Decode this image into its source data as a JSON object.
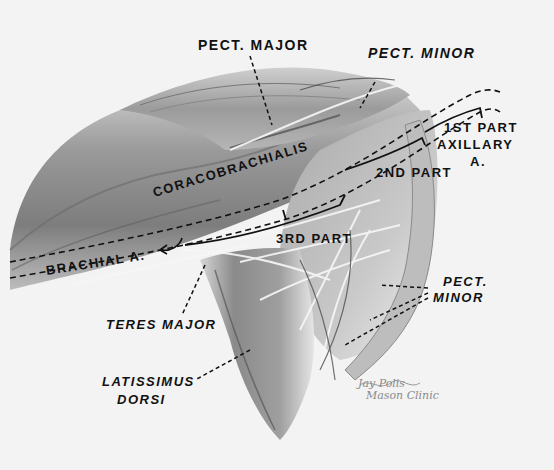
{
  "figure": {
    "colors": {
      "background": "#f3f3f3",
      "label_ink": "#111111",
      "muscle_dark": "#5a5a5a",
      "muscle_mid": "#8c8c8c",
      "muscle_light": "#c9c9c9",
      "nerve_white": "#f5f5f5",
      "signature": "#8a8a8a"
    }
  },
  "labels": {
    "pect_major": "PECT. MAJOR",
    "pect_minor_top": "PECT. MINOR",
    "first_part": "1ST PART",
    "axillary": "AXILLARY",
    "axillary_a": "A.",
    "second_part": "2ND PART",
    "coracobrachialis": "CORACOBRACHIALIS",
    "third_part": "3RD PART",
    "brachial_a": "BRACHIAL A.",
    "teres_major": "TERES MAJOR",
    "pect_minor_bottom_1": "PECT.",
    "pect_minor_bottom_2": "MINOR",
    "latissimus": "LATISSIMUS",
    "dorsi": "DORSI"
  },
  "signature": {
    "line1": "Jay Polis",
    "line2": "Mason Clinic"
  }
}
